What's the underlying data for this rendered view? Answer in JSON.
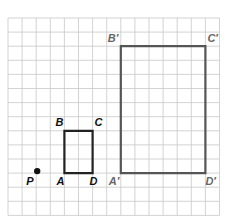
{
  "diagram": {
    "type": "dilation-on-grid",
    "grid": {
      "left": 8,
      "top": 18,
      "cell": 14.1,
      "cols": 15,
      "rows": 14,
      "line_color": "#c8c8c8",
      "border_color": "#bbbbbb"
    },
    "center": {
      "label": "P",
      "col": 2,
      "row": 11
    },
    "original": {
      "color": "#222222",
      "vertices": [
        {
          "label": "A",
          "col": 4,
          "row": 11
        },
        {
          "label": "B",
          "col": 4,
          "row": 8
        },
        {
          "label": "C",
          "col": 6,
          "row": 8
        },
        {
          "label": "D",
          "col": 6,
          "row": 11
        }
      ]
    },
    "image": {
      "color": "#555555",
      "label_color": "#666666",
      "vertices": [
        {
          "label": "A′",
          "col": 8,
          "row": 11
        },
        {
          "label": "B′",
          "col": 8,
          "row": 2
        },
        {
          "label": "C′",
          "col": 14,
          "row": 2
        },
        {
          "label": "D′",
          "col": 14,
          "row": 11
        }
      ]
    }
  }
}
